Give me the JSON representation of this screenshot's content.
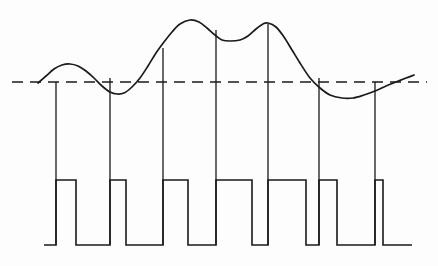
{
  "figure": {
    "background_color": "#fdfdfd",
    "ink_color": "#1a1a1a"
  },
  "chart_data": {
    "type": "line",
    "title": "",
    "subtitle": "",
    "xlabel": "",
    "ylabel": "",
    "xlim": [
      0,
      438
    ],
    "ylim": [
      266,
      0
    ],
    "grid": false,
    "legend": null,
    "axis_ticks": {
      "x": [],
      "y": []
    },
    "series": [
      {
        "name": "analog-signal",
        "style": "solid",
        "stroke": "#1a1a1a",
        "points": [
          [
            38,
            83
          ],
          [
            46,
            76
          ],
          [
            54,
            69
          ],
          [
            62,
            65
          ],
          [
            70,
            64
          ],
          [
            78,
            66
          ],
          [
            86,
            71
          ],
          [
            94,
            78
          ],
          [
            102,
            86
          ],
          [
            110,
            92
          ],
          [
            117,
            94
          ],
          [
            124,
            93
          ],
          [
            132,
            87
          ],
          [
            140,
            78
          ],
          [
            148,
            66
          ],
          [
            156,
            53
          ],
          [
            164,
            42
          ],
          [
            172,
            32
          ],
          [
            180,
            24
          ],
          [
            190,
            20
          ],
          [
            199,
            22
          ],
          [
            207,
            28
          ],
          [
            215,
            35
          ],
          [
            222,
            40
          ],
          [
            230,
            41
          ],
          [
            240,
            40
          ],
          [
            248,
            36
          ],
          [
            256,
            29
          ],
          [
            263,
            24
          ],
          [
            268,
            23
          ],
          [
            276,
            27
          ],
          [
            284,
            37
          ],
          [
            292,
            50
          ],
          [
            300,
            63
          ],
          [
            310,
            78
          ],
          [
            320,
            88
          ],
          [
            330,
            95
          ],
          [
            342,
            98
          ],
          [
            353,
            98
          ],
          [
            364,
            95
          ],
          [
            375,
            91
          ],
          [
            386,
            86
          ],
          [
            396,
            82
          ],
          [
            406,
            78
          ],
          [
            414,
            75
          ]
        ]
      },
      {
        "name": "pwm-output",
        "style": "square",
        "stroke": "#1a1a1a",
        "baseline_y": 245,
        "high_y": 180,
        "start_x": 44,
        "end_x": 412,
        "pulses": [
          {
            "rise_x": 56,
            "fall_x": 76
          },
          {
            "rise_x": 110,
            "fall_x": 126
          },
          {
            "rise_x": 163,
            "fall_x": 188
          },
          {
            "rise_x": 216,
            "fall_x": 252
          },
          {
            "rise_x": 268,
            "fall_x": 306
          },
          {
            "rise_x": 319,
            "fall_x": 337
          },
          {
            "rise_x": 375,
            "fall_x": 383
          }
        ]
      }
    ],
    "reference_line": {
      "name": "threshold-level",
      "style": "dashed",
      "stroke": "#1a1a1a",
      "y": 82,
      "x_start": 12,
      "x_end": 427
    },
    "sample_lines": {
      "name": "sampling-instants",
      "stroke": "#1a1a1a",
      "top_y": 82,
      "bottom_y": 245,
      "x_positions": [
        56,
        110,
        163,
        216,
        268,
        319,
        375
      ],
      "tops": [
        82,
        78,
        48,
        30,
        24,
        78,
        82
      ]
    },
    "annotations": []
  }
}
